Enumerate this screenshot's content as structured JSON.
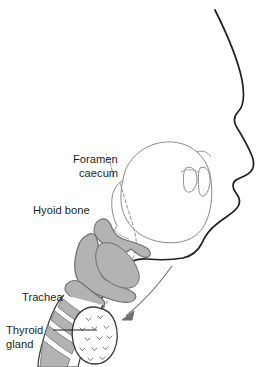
{
  "figure": {
    "background_color": "#ffffff",
    "outline_color": "#231f20",
    "cartilage_fill": "#b3b3b3",
    "cartilage_stroke": "#6e6e6e",
    "faint_stroke": "#9a9a9a",
    "text_color": "#231f20"
  },
  "labels": {
    "foramen_caecum": {
      "line1": "Foramen",
      "line2": "caecum",
      "x": 66,
      "y": 160
    },
    "hyoid_bone": {
      "text": "Hyoid bone",
      "x": 33,
      "y": 211
    },
    "trachea": {
      "text": "Trachea",
      "x": 22,
      "y": 299
    },
    "thyroid_gland": {
      "line1": "Thyroid",
      "line2": "gland",
      "x": 5,
      "y": 334
    }
  },
  "structures": [
    {
      "name": "head-profile-outline",
      "description": "Facial profile from forehead through nose, lips, chin and neck"
    },
    {
      "name": "tongue-outline",
      "description": "Oral tongue dome with foramen caecum at its root"
    },
    {
      "name": "teeth-outline",
      "description": "Upper and lower incisor outlines behind the lips"
    },
    {
      "name": "hyoid-bone",
      "description": "Hook shaped hyoid bone, shaded grey"
    },
    {
      "name": "thyroid-cartilage",
      "description": "Large grey thyroid cartilage of the larynx"
    },
    {
      "name": "cricoid-cartilage",
      "description": "Grey cricoid cartilage below thyroid cartilage"
    },
    {
      "name": "trachea-rings",
      "description": "Banded tracheal cartilage rings, alternating grey and white"
    },
    {
      "name": "thyroid-gland",
      "description": "Stippled thyroid gland overlying upper trachea"
    },
    {
      "name": "thyroglossal-duct-tract",
      "description": "Dashed line running from foramen caecum down to thyroid gland"
    },
    {
      "name": "descent-arrow",
      "description": "Arrow indicating descent of the thyroid gland"
    },
    {
      "name": "thyroid-gland-leader-line",
      "description": "Straight leader line from Thyroid gland label to the gland"
    }
  ]
}
